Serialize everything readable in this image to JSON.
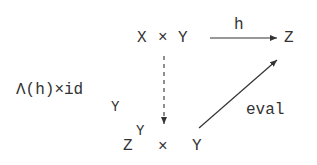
{
  "diagram": {
    "nodes": {
      "product_xy": {
        "x": "X",
        "times": "×",
        "y": "Y"
      },
      "target_z": {
        "label": "Z"
      },
      "exp_product": {
        "base": "Z",
        "exponent": "Y",
        "times": "×",
        "y": "Y"
      }
    },
    "edges": {
      "h": {
        "label": "h",
        "from": "X × Y",
        "to": "Z",
        "style": "solid"
      },
      "curry": {
        "label": "Λ(h)×id",
        "subscript": "Y",
        "from": "X × Y",
        "to": "Z^Y × Y",
        "style": "dashed"
      },
      "eval": {
        "label": "eval",
        "from": "Z^Y × Y",
        "to": "Z",
        "style": "solid"
      }
    },
    "colors": {
      "ink": "#333333",
      "background": "#ffffff"
    }
  }
}
